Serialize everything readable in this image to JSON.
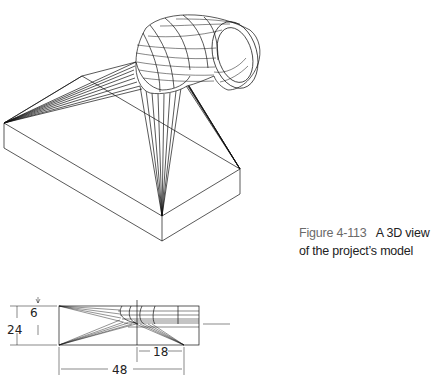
{
  "caption": {
    "figure_number": "Figure 4-113",
    "text": "A 3D view of the project’s model"
  },
  "drawing": {
    "views": [
      "isometric-3d-view",
      "front-view"
    ],
    "dimensions": {
      "small_height": "6",
      "total_height": "24",
      "offset_width": "18",
      "total_width": "48"
    }
  }
}
